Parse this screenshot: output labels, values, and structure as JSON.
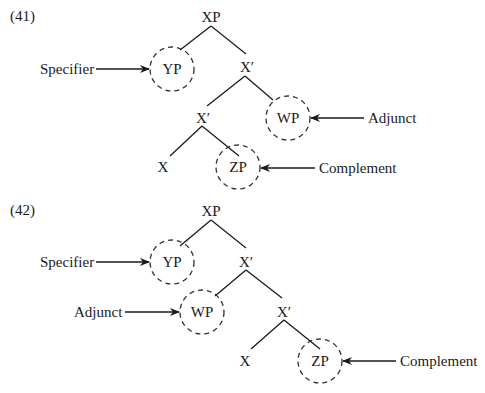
{
  "diagrams": [
    {
      "number": "(41)",
      "nodes": {
        "root": "XP",
        "specifier": "YP",
        "xbar_upper": "X′",
        "xbar_lower": "X′",
        "adjunct": "WP",
        "head": "X",
        "complement": "ZP"
      },
      "labels": {
        "specifier": "Specifier",
        "adjunct": "Adjunct",
        "complement": "Complement"
      }
    },
    {
      "number": "(42)",
      "nodes": {
        "root": "XP",
        "specifier": "YP",
        "xbar_upper": "X′",
        "adjunct": "WP",
        "xbar_lower": "X′",
        "head": "X",
        "complement": "ZP"
      },
      "labels": {
        "specifier": "Specifier",
        "adjunct": "Adjunct",
        "complement": "Complement"
      }
    }
  ]
}
